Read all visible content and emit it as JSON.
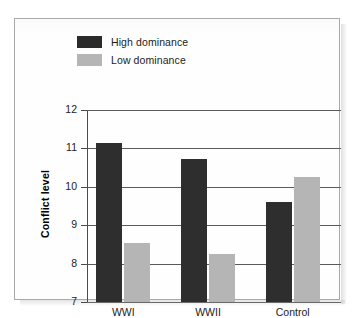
{
  "chart_data": {
    "type": "bar",
    "title": "",
    "xlabel": "",
    "ylabel": "Conflict level",
    "categories": [
      "WWI",
      "WWII",
      "Control"
    ],
    "series": [
      {
        "name": "High dominance",
        "color": "#2e2e2e",
        "values": [
          11.15,
          10.72,
          9.6
        ]
      },
      {
        "name": "Low dominance",
        "color": "#b5b5b5",
        "values": [
          8.54,
          8.25,
          10.25
        ]
      }
    ],
    "ylim": [
      7,
      12
    ],
    "yticks": [
      "7",
      "8",
      "9",
      "10",
      "11",
      "12"
    ],
    "grid": true,
    "legend_position": "top-left"
  },
  "legend": {
    "items": [
      {
        "label": "High dominance",
        "swatch": "high"
      },
      {
        "label": "Low dominance",
        "swatch": "low"
      }
    ]
  },
  "axis": {
    "y_title": "Conflict level",
    "y_ticks": [
      "12",
      "11",
      "10",
      "9",
      "8",
      "7"
    ],
    "x_ticks": [
      "WWI",
      "WWII",
      "Control"
    ]
  }
}
